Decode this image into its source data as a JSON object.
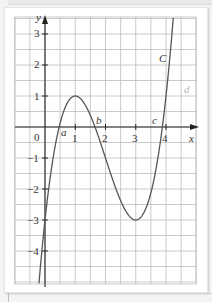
{
  "figure": {
    "x_axis_label": "x",
    "y_axis_label": "y",
    "origin_label": "0",
    "x_ticks": [
      {
        "value": 1,
        "label": "1"
      },
      {
        "value": 2,
        "label": "2"
      },
      {
        "value": 3,
        "label": "3"
      },
      {
        "value": 4,
        "label": "4"
      }
    ],
    "y_ticks": [
      {
        "value": 3,
        "label": "3"
      },
      {
        "value": 2,
        "label": "2"
      },
      {
        "value": 1,
        "label": "1"
      },
      {
        "value": -1,
        "label": "−1"
      },
      {
        "value": -2,
        "label": "−2"
      },
      {
        "value": -3,
        "label": "−3"
      },
      {
        "value": -4,
        "label": "−4"
      }
    ],
    "curve_label": "C",
    "root_labels": {
      "a": "a",
      "b": "b",
      "c": "c"
    },
    "extra_label": "d",
    "curve_color": "#555555",
    "grid_color": "#bdbdbd",
    "axis_color": "#222222"
  },
  "chart_data": {
    "type": "line",
    "title": "",
    "xlabel": "x",
    "ylabel": "y",
    "function": "y = x^3 - 6x^2 + 9x - 3",
    "xlim": [
      -1,
      5
    ],
    "ylim": [
      -5.1,
      3.5
    ],
    "grid": true,
    "grid_step": 0.5,
    "key_points": [
      {
        "x": 0,
        "y": -3,
        "note": "y-intercept"
      },
      {
        "x": 1,
        "y": 1,
        "note": "local maximum"
      },
      {
        "x": 3,
        "y": -3,
        "note": "local minimum"
      }
    ],
    "roots": [
      {
        "label": "a",
        "x": 0.47
      },
      {
        "label": "b",
        "x": 1.65
      },
      {
        "label": "c",
        "x": 3.88
      }
    ],
    "series": [
      {
        "name": "C",
        "x": [
          -0.35,
          0,
          0.5,
          1,
          1.5,
          2,
          2.5,
          3,
          3.5,
          4,
          4.18
        ],
        "y": [
          -6.99,
          -3,
          0.125,
          1,
          0.375,
          -1,
          -2.375,
          -3,
          -1.625,
          1,
          3.6
        ]
      }
    ],
    "annotations": [
      "C",
      "a",
      "b",
      "c",
      "d",
      "0"
    ]
  }
}
